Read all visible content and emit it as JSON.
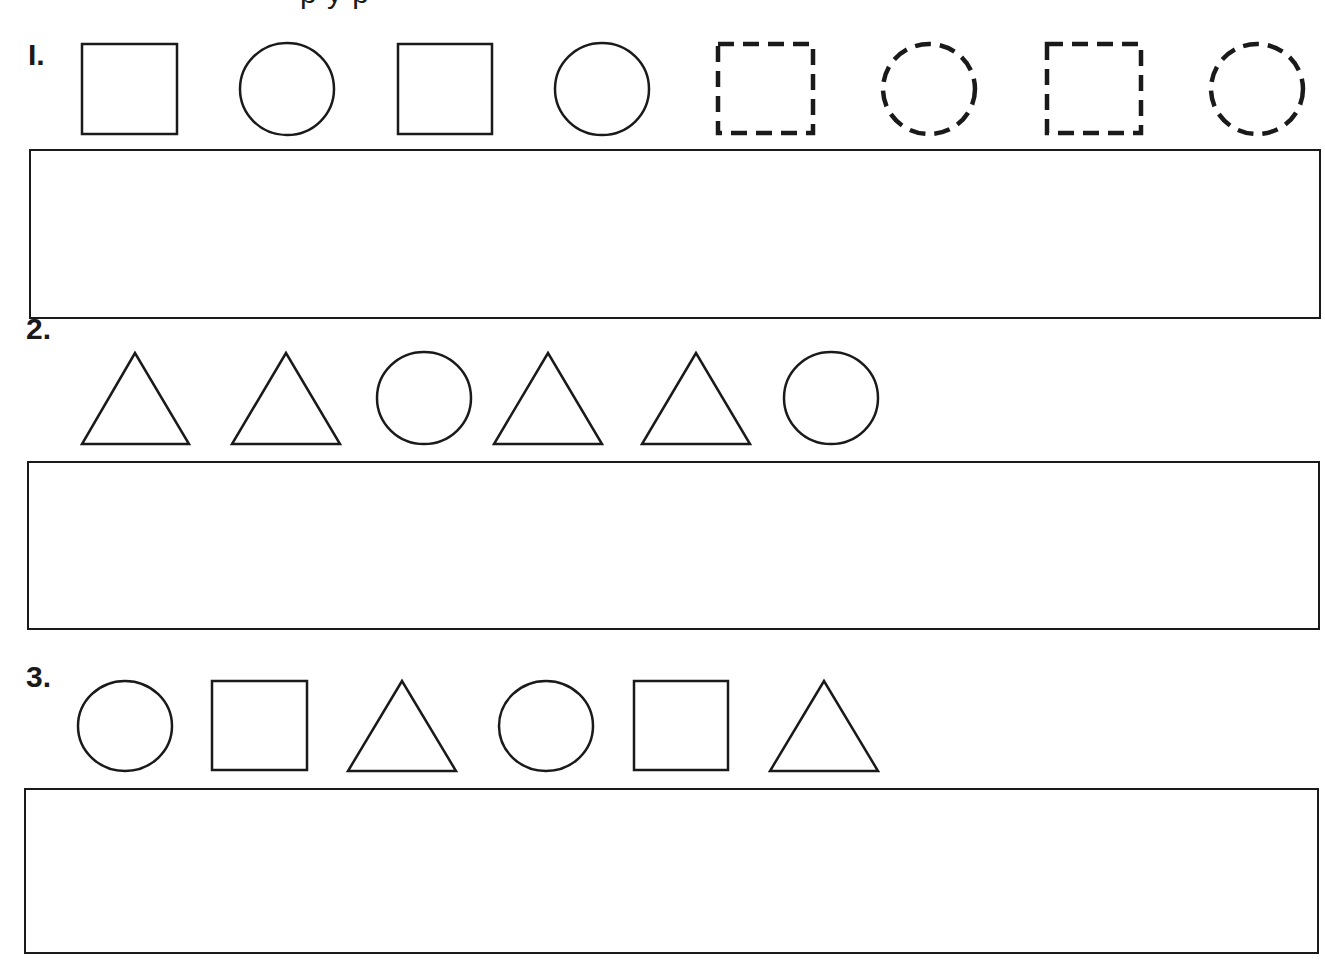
{
  "worksheet": {
    "heading_cropped": "p               y         p",
    "problems": [
      {
        "number": "I.",
        "sequence": [
          "square",
          "circle",
          "square",
          "circle",
          "dashed-square",
          "dashed-circle",
          "dashed-square",
          "dashed-circle"
        ],
        "answer_box": ""
      },
      {
        "number": "2.",
        "sequence": [
          "triangle",
          "triangle",
          "circle",
          "triangle",
          "triangle",
          "circle"
        ],
        "answer_box": ""
      },
      {
        "number": "3.",
        "sequence": [
          "circle",
          "square",
          "triangle",
          "circle",
          "square",
          "triangle"
        ],
        "answer_box": ""
      }
    ],
    "colors": {
      "ink": "#1a1a1a",
      "paper": "#ffffff"
    }
  }
}
